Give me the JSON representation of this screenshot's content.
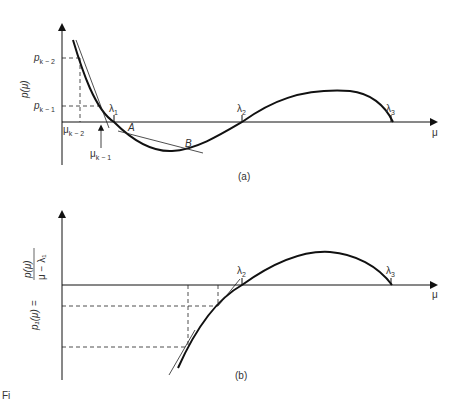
{
  "figure_a": {
    "caption": "(a)",
    "y_axis_label": "p(μ)",
    "x_axis_label": "μ",
    "y_ticks": [
      {
        "base": "p",
        "sub": "k − 2"
      },
      {
        "base": "p",
        "sub": "k − 1"
      }
    ],
    "x_ticks": [
      {
        "base": "μ",
        "sub": "k − 2"
      },
      {
        "base": "μ",
        "sub": "k − 1"
      }
    ],
    "roots": [
      {
        "base": "λ",
        "sub": "1"
      },
      {
        "base": "λ",
        "sub": "2"
      },
      {
        "base": "λ",
        "sub": "3"
      }
    ],
    "points": [
      "A",
      "B"
    ]
  },
  "figure_b": {
    "caption": "(b)",
    "y_axis_label_lhs": "p₁(μ) =",
    "y_axis_label_num": "p(μ)",
    "y_axis_label_den": "μ − λ₁",
    "x_axis_label": "μ",
    "roots": [
      {
        "base": "λ",
        "sub": "2"
      },
      {
        "base": "λ",
        "sub": "3"
      }
    ]
  },
  "footer_fragment": "Fi"
}
